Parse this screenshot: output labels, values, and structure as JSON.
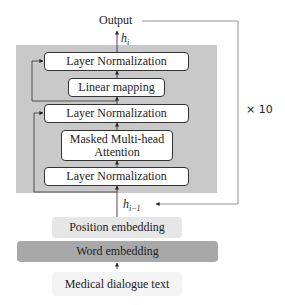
{
  "diagram": {
    "output_label": "Output",
    "h_out": {
      "base": "h",
      "sub": "i"
    },
    "h_in": {
      "base": "h",
      "sub": "i−1"
    },
    "repeat_label": "× 10",
    "block": {
      "layers": [
        {
          "id": "ln_top",
          "label": "Layer Normalization"
        },
        {
          "id": "linear",
          "label": "Linear mapping"
        },
        {
          "id": "ln_mid",
          "label": "Layer Normalization"
        },
        {
          "id": "mmha",
          "label": "Masked Multi-head Attention",
          "lines": [
            "Masked Multi-head",
            "Attention"
          ]
        },
        {
          "id": "ln_bottom",
          "label": "Layer Normalization"
        }
      ]
    },
    "position_embedding": "Position embedding",
    "word_embedding": "Word embedding",
    "input_label": "Medical dialogue text"
  },
  "colors": {
    "block_background": "#c9c9c9",
    "position_embedding_bg": "#e6e6e6",
    "word_embedding_bg": "#a8a8a8",
    "input_bg": "#f4f4f4",
    "line": "#333333"
  }
}
